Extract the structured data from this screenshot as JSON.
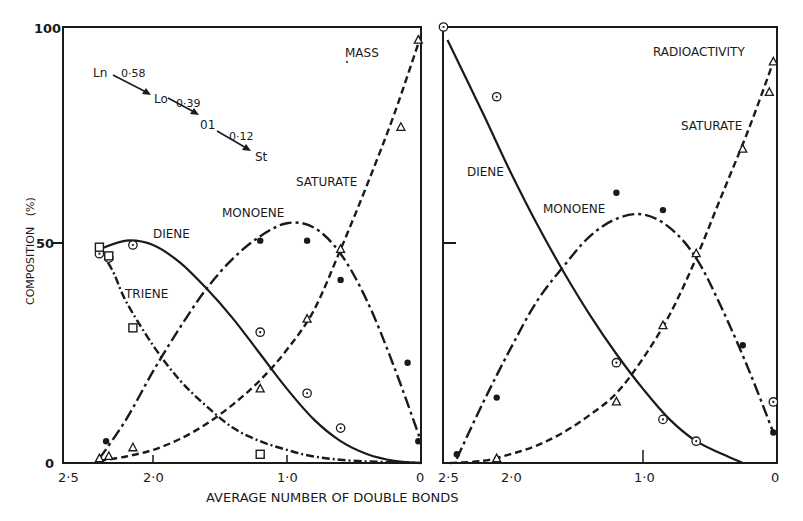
{
  "chart_data": [
    {
      "type": "line",
      "panel": "left",
      "title": "MASS",
      "xlabel": "AVERAGE NUMBER OF DOUBLE BONDS",
      "ylabel": "COMPOSITION (%)",
      "xlim": [
        2.5,
        0
      ],
      "ylim": [
        0,
        100
      ],
      "x_ticks": [
        "2·5",
        "2·0",
        "1·0",
        "0"
      ],
      "y_ticks": [
        "0",
        "50",
        "100"
      ],
      "grid": false,
      "annotation": {
        "scheme": [
          {
            "from": "Ln",
            "to": "Lo",
            "value": "0·58"
          },
          {
            "from": "Lo",
            "to": "01",
            "value": "0·39"
          },
          {
            "from": "01",
            "to": "St",
            "value": "0·12"
          }
        ]
      },
      "series": [
        {
          "name": "DIENE",
          "marker": "circle-dot",
          "line": "solid",
          "points": [
            [
              2.4,
              48
            ],
            [
              2.33,
              47
            ],
            [
              2.15,
              50
            ],
            [
              1.2,
              30
            ],
            [
              0.85,
              16
            ],
            [
              0.6,
              8
            ]
          ],
          "curve": [
            [
              2.4,
              49
            ],
            [
              2.2,
              51
            ],
            [
              2.0,
              50
            ],
            [
              1.8,
              46
            ],
            [
              1.6,
              40
            ],
            [
              1.4,
              33
            ],
            [
              1.2,
              25
            ],
            [
              1.0,
              17
            ],
            [
              0.8,
              10
            ],
            [
              0.6,
              5
            ],
            [
              0.4,
              2
            ],
            [
              0.2,
              0.5
            ],
            [
              0,
              0
            ]
          ]
        },
        {
          "name": "TRIENE",
          "marker": "square",
          "line": "dash-dot",
          "points": [
            [
              2.4,
              49.5
            ],
            [
              2.33,
              47.5
            ],
            [
              2.15,
              31
            ],
            [
              1.2,
              2
            ]
          ],
          "curve": [
            [
              2.4,
              49
            ],
            [
              2.3,
              44
            ],
            [
              2.2,
              37
            ],
            [
              2.0,
              27
            ],
            [
              1.8,
              19
            ],
            [
              1.6,
              13
            ],
            [
              1.4,
              8
            ],
            [
              1.2,
              5
            ],
            [
              1.0,
              3
            ],
            [
              0.8,
              1.5
            ],
            [
              0.5,
              0.5
            ],
            [
              0,
              0
            ]
          ]
        },
        {
          "name": "MONOENE",
          "marker": "filled-dot",
          "line": "long-dash-dot",
          "points": [
            [
              2.35,
              5
            ],
            [
              1.2,
              51
            ],
            [
              0.85,
              51
            ],
            [
              0.6,
              42
            ],
            [
              0.1,
              23
            ],
            [
              0.02,
              5
            ]
          ],
          "curve": [
            [
              2.4,
              1
            ],
            [
              2.2,
              10
            ],
            [
              2.0,
              21
            ],
            [
              1.8,
              31
            ],
            [
              1.6,
              40
            ],
            [
              1.4,
              47
            ],
            [
              1.2,
              52
            ],
            [
              1.0,
              55
            ],
            [
              0.8,
              54
            ],
            [
              0.6,
              48
            ],
            [
              0.4,
              37
            ],
            [
              0.2,
              22
            ],
            [
              0,
              5
            ]
          ]
        },
        {
          "name": "SATURATE",
          "marker": "triangle",
          "line": "dashed",
          "points": [
            [
              2.4,
              1
            ],
            [
              2.33,
              1.5
            ],
            [
              2.15,
              3.5
            ],
            [
              1.2,
              17
            ],
            [
              0.85,
              33
            ],
            [
              0.6,
              49
            ],
            [
              0.15,
              77
            ],
            [
              0.02,
              97
            ]
          ],
          "curve": [
            [
              2.4,
              0.5
            ],
            [
              2.2,
              1.5
            ],
            [
              2.0,
              3
            ],
            [
              1.8,
              5.5
            ],
            [
              1.6,
              9
            ],
            [
              1.4,
              13.5
            ],
            [
              1.2,
              19
            ],
            [
              1.0,
              26
            ],
            [
              0.8,
              35
            ],
            [
              0.6,
              49
            ],
            [
              0.4,
              64
            ],
            [
              0.2,
              80
            ],
            [
              0,
              98
            ]
          ]
        }
      ]
    },
    {
      "type": "line",
      "panel": "right",
      "title": "RADIOACTIVITY",
      "xlabel": "AVERAGE NUMBER OF DOUBLE BONDS",
      "xlim": [
        2.5,
        0
      ],
      "ylim": [
        0,
        100
      ],
      "x_ticks": [
        "2·5",
        "2·0",
        "1·0",
        "0"
      ],
      "grid": false,
      "series": [
        {
          "name": "DIENE",
          "marker": "circle-dot",
          "line": "solid",
          "points": [
            [
              2.5,
              100
            ],
            [
              2.1,
              84
            ],
            [
              1.2,
              23
            ],
            [
              0.85,
              10
            ],
            [
              0.6,
              5
            ],
            [
              0.02,
              14
            ]
          ],
          "curve": [
            [
              2.47,
              97
            ],
            [
              2.2,
              80
            ],
            [
              2.0,
              67
            ],
            [
              1.8,
              55
            ],
            [
              1.6,
              44
            ],
            [
              1.4,
              34
            ],
            [
              1.2,
              25
            ],
            [
              1.0,
              17
            ],
            [
              0.8,
              10
            ],
            [
              0.6,
              5
            ],
            [
              0.4,
              2
            ],
            [
              0.25,
              0
            ]
          ]
        },
        {
          "name": "MONOENE",
          "marker": "filled-dot",
          "line": "long-dash-dot",
          "points": [
            [
              2.4,
              2
            ],
            [
              2.1,
              15
            ],
            [
              1.2,
              62
            ],
            [
              0.85,
              58
            ],
            [
              0.25,
              27
            ],
            [
              0.02,
              7
            ]
          ],
          "curve": [
            [
              2.4,
              1
            ],
            [
              2.2,
              14
            ],
            [
              2.0,
              26
            ],
            [
              1.8,
              37
            ],
            [
              1.6,
              45
            ],
            [
              1.4,
              52
            ],
            [
              1.2,
              56
            ],
            [
              1.0,
              57
            ],
            [
              0.8,
              54
            ],
            [
              0.6,
              47
            ],
            [
              0.4,
              35
            ],
            [
              0.2,
              21
            ],
            [
              0.02,
              7
            ]
          ]
        },
        {
          "name": "SATURATE",
          "marker": "triangle",
          "line": "dashed",
          "points": [
            [
              2.1,
              1
            ],
            [
              1.2,
              14
            ],
            [
              0.85,
              31.5
            ],
            [
              0.6,
              48
            ],
            [
              0.25,
              72
            ],
            [
              0.05,
              85
            ],
            [
              0.02,
              92
            ]
          ],
          "curve": [
            [
              2.45,
              0
            ],
            [
              2.2,
              0.5
            ],
            [
              2.0,
              2
            ],
            [
              1.8,
              4
            ],
            [
              1.6,
              7
            ],
            [
              1.4,
              11
            ],
            [
              1.2,
              16
            ],
            [
              1.0,
              24
            ],
            [
              0.8,
              34
            ],
            [
              0.6,
              47
            ],
            [
              0.4,
              62
            ],
            [
              0.2,
              77
            ],
            [
              0.02,
              92
            ]
          ]
        }
      ]
    }
  ],
  "labels": {
    "left": {
      "mass": "MASS",
      "saturate": "SATURATE",
      "monoene": "MONOENE",
      "diene": "DIENE",
      "triene": "TRIENE",
      "ln": "Ln",
      "lo": "Lo",
      "ol": "01",
      "st": "St",
      "k1": "0·58",
      "k2": "0·39",
      "k3": "0·12"
    },
    "right": {
      "radioactivity": "RADIOACTIVITY",
      "saturate": "SATURATE",
      "monoene": "MONOENE",
      "diene": "DIENE"
    },
    "yaxis": {
      "title": "COMPOSITION   (%)",
      "t100": "100",
      "t50": "50",
      "t0": "0"
    },
    "xaxis": {
      "title": "AVERAGE NUMBER OF DOUBLE BONDS",
      "left_ticks": [
        "2·5",
        "2·0",
        "1·0",
        "0"
      ],
      "right_ticks": [
        "2·5",
        "2·0",
        "1·0",
        "0"
      ]
    }
  }
}
